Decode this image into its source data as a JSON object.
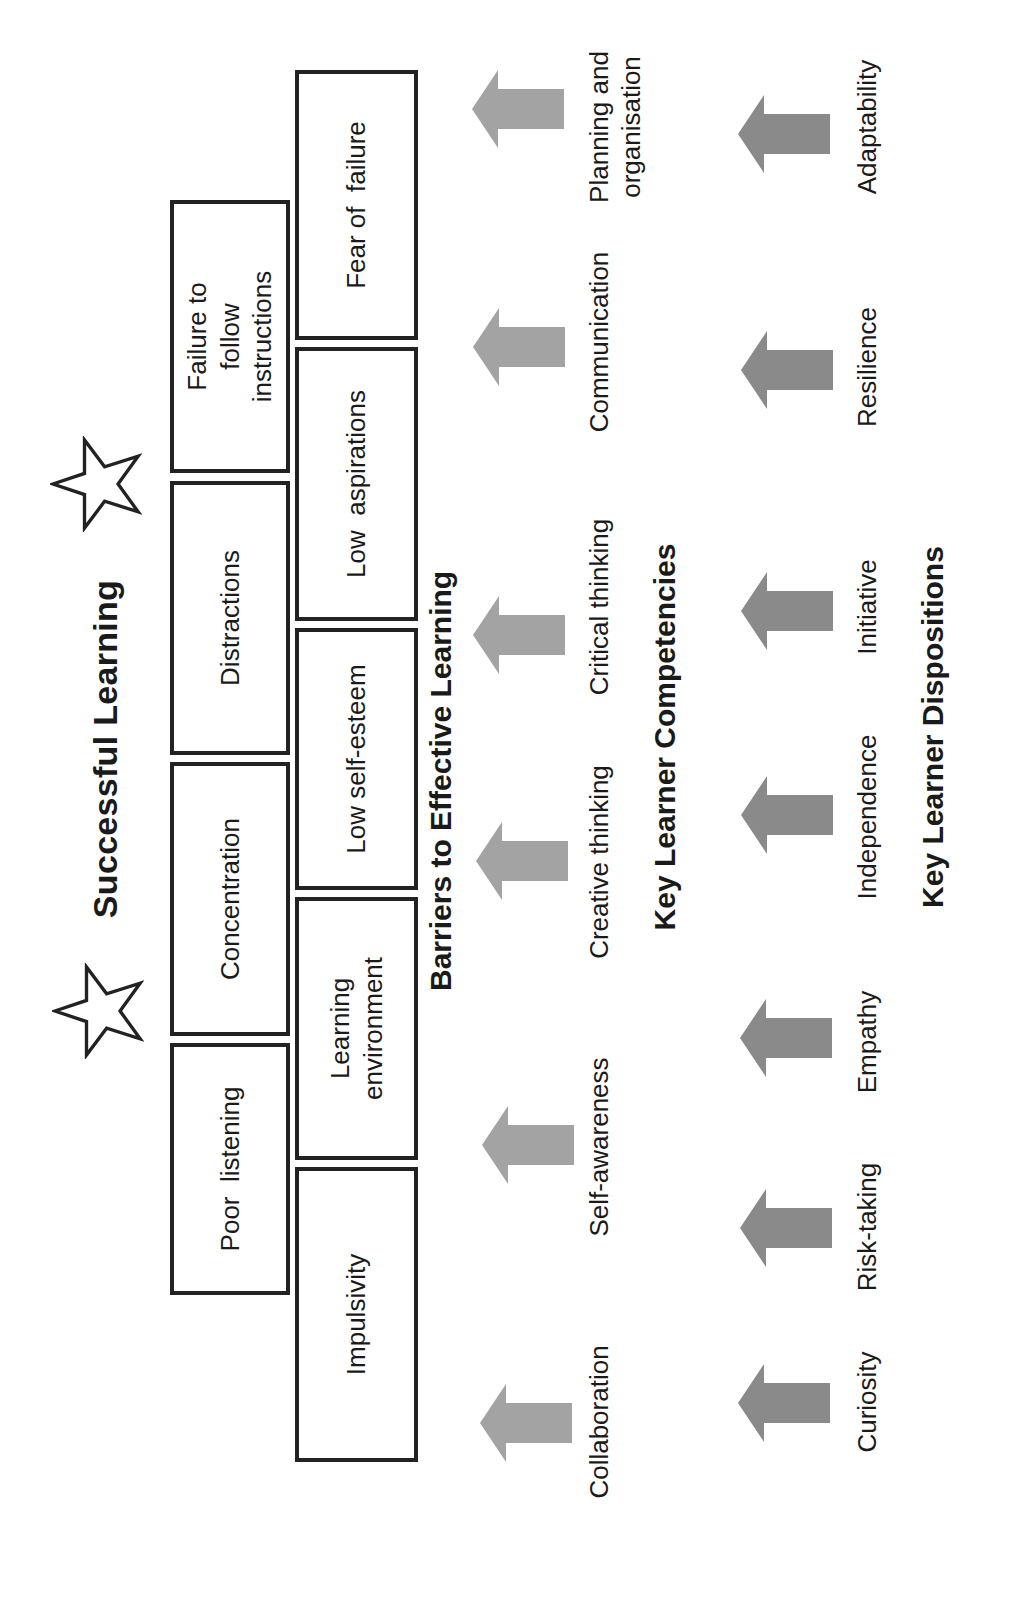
{
  "title": "Successful Learning",
  "barriers": {
    "heading": "Barriers to Effective Learning",
    "top_row": [
      {
        "label": "Poor  listening"
      },
      {
        "label": "Concentration"
      },
      {
        "label": "Distractions"
      },
      {
        "label": "Failure to follow instructions"
      }
    ],
    "bottom_row": [
      {
        "label": "Impulsivity"
      },
      {
        "label": "Learning environment"
      },
      {
        "label": "Low self-esteem"
      },
      {
        "label": "Low  aspirations"
      },
      {
        "label": "Fear of  failure"
      }
    ]
  },
  "competencies": {
    "heading": "Key Learner Competencies",
    "items": [
      {
        "label": "Collaboration"
      },
      {
        "label": "Self-awareness"
      },
      {
        "label": "Creative thinking"
      },
      {
        "label": "Critical thinking"
      },
      {
        "label": "Communication"
      },
      {
        "label": "Planning and organisation"
      }
    ],
    "arrow_color": "#a3a3a3"
  },
  "dispositions": {
    "heading": "Key Learner Dispositions",
    "items": [
      {
        "label": "Curiosity"
      },
      {
        "label": "Risk-taking"
      },
      {
        "label": "Empathy"
      },
      {
        "label": "Independence"
      },
      {
        "label": "Initiative"
      },
      {
        "label": "Resilience"
      },
      {
        "label": "Adaptability"
      }
    ],
    "arrow_color": "#8a8a8a"
  },
  "icons": {
    "star": "star-outline-icon",
    "arrow": "up-arrow-icon"
  }
}
